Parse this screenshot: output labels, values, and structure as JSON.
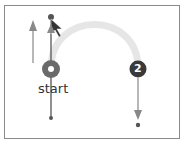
{
  "diagram": {
    "start_label": "start",
    "step2_label": "2",
    "colors": {
      "frame": "#8a8a8a",
      "arc": "#e6e6e6",
      "marker": "#4a4a4a",
      "line": "#555555",
      "arrow": "#888888",
      "text": "#333333"
    }
  }
}
